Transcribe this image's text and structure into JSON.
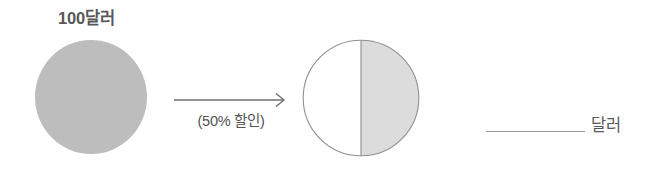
{
  "problem": {
    "original": {
      "label": "100달러",
      "icon": "full-circle-icon",
      "fill_color": "#bdbdbd"
    },
    "transform": {
      "label": "(50% 할인)",
      "icon": "right-arrow-icon",
      "line_color": "#6f6f6f"
    },
    "result": {
      "icon": "half-shaded-circle-icon",
      "shaded_fill": "#dcdcdc",
      "empty_fill": "#ffffff",
      "outline_color": "#8f8f8f"
    },
    "answer": {
      "blank_value": "",
      "blank_placeholder": "",
      "unit": "달러",
      "line_color": "#9b9b9b"
    }
  },
  "theme": {
    "background": "#ffffff",
    "text_color": "#58585a"
  }
}
